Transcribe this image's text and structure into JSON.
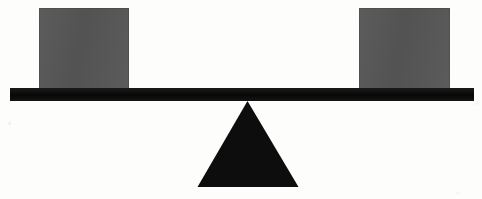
{
  "diagram": {
    "type": "physics-lever-balance",
    "background_color": "#fdfdfc",
    "state": "balanced",
    "canvas": {
      "width": 482,
      "height": 199
    }
  },
  "parts": {
    "block_left": {
      "label": "left block",
      "color": "#565656",
      "x": 39,
      "y": 8,
      "width": 90,
      "height": 81
    },
    "block_right": {
      "label": "right block",
      "color": "#565656",
      "x": 359,
      "y": 8,
      "width": 91,
      "height": 81
    },
    "plank": {
      "label": "lever beam",
      "color": "#0d0d0d",
      "x": 10,
      "y": 88,
      "width": 464,
      "height": 13
    },
    "fulcrum": {
      "label": "triangular fulcrum",
      "color": "#0d0d0d",
      "apex_x": 246,
      "apex_y": 101,
      "base_left_x": 196,
      "base_right_x": 297,
      "base_y": 187
    }
  },
  "colors": {
    "block_gray": "#565656",
    "ink_black": "#0d0d0d",
    "paper_white": "#fdfdfc"
  }
}
